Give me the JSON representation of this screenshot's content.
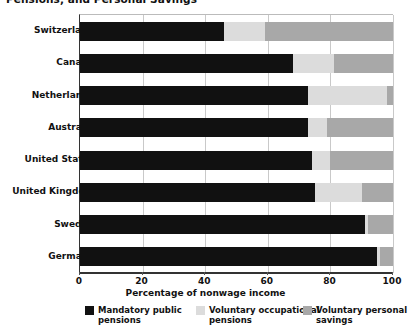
{
  "title": "Pensions, and Personal Savings",
  "chart_data": {
    "type": "bar",
    "orientation": "horizontal",
    "stacked": true,
    "title": "Pensions, and Personal Savings",
    "xlabel": "Percentage of nonwage income",
    "ylabel": "",
    "xlim": [
      0,
      100
    ],
    "xticks": [
      0,
      20,
      40,
      60,
      80,
      100
    ],
    "grid": "vertical",
    "legend_position": "bottom",
    "categories": [
      "Switzerland",
      "Canada",
      "Netherlands",
      "Australia",
      "United States",
      "United Kingdom",
      "Sweden",
      "Germany"
    ],
    "series": [
      {
        "name": "Mandatory public pensions",
        "color": "#111111",
        "values": [
          46,
          68,
          73,
          73,
          74,
          75,
          91,
          95
        ]
      },
      {
        "name": "Voluntary occupational pensions",
        "color": "#dcdcdc",
        "values": [
          13,
          13,
          25,
          6,
          6,
          15,
          1,
          1
        ]
      },
      {
        "name": "Voluntary personal savings",
        "color": "#a8a8a8",
        "values": [
          41,
          19,
          2,
          21,
          20,
          10,
          8,
          4
        ]
      }
    ]
  },
  "legend": {
    "items": [
      {
        "label": "Mandatory public\npensions",
        "color": "#111111"
      },
      {
        "label": "Voluntary occupational\npensions",
        "color": "#dcdcdc"
      },
      {
        "label": "Voluntary personal\nsavings",
        "color": "#a8a8a8"
      }
    ]
  }
}
